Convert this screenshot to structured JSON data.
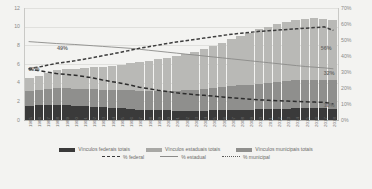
{
  "chart_data": {
    "type": "bar",
    "title": "",
    "subtitle": "",
    "xlabel": "",
    "ylabel": "",
    "y2label": "",
    "grid": true,
    "legend_position": "bottom",
    "categories": [
      "1985",
      "1986",
      "1987",
      "1988",
      "1989",
      "1990",
      "1991",
      "1992",
      "1993",
      "1994",
      "1995",
      "1996",
      "1997",
      "1998",
      "1999",
      "2000",
      "2001",
      "2002",
      "2003",
      "2004",
      "2005",
      "2006",
      "2007",
      "2008",
      "2009",
      "2010",
      "2011",
      "2012",
      "2013",
      "2014",
      "2015",
      "2016",
      "2017",
      "2018"
    ],
    "ylim": [
      0,
      12
    ],
    "yticks": [
      "0",
      "2",
      "4",
      "6",
      "8",
      "10",
      "12"
    ],
    "y2lim": [
      0,
      70
    ],
    "y2ticks": [
      "0%",
      "10%",
      "20%",
      "30%",
      "40%",
      "50%",
      "60%",
      "70%"
    ],
    "series": [
      {
        "name": "Vínculos federais totais",
        "type": "bar-stack",
        "color": "#3a3a3a",
        "values": [
          1.55,
          1.58,
          1.6,
          1.62,
          1.58,
          1.55,
          1.5,
          1.42,
          1.35,
          1.3,
          1.25,
          1.2,
          1.12,
          1.08,
          1.05,
          1.02,
          1.0,
          0.98,
          0.98,
          1.0,
          1.02,
          1.05,
          1.08,
          1.1,
          1.12,
          1.15,
          1.18,
          1.2,
          1.22,
          1.24,
          1.25,
          1.25,
          1.24,
          1.22
        ]
      },
      {
        "name": "Vínculos estaduais totais",
        "type": "bar-stack",
        "color": "#8f8f8d",
        "values": [
          1.55,
          1.62,
          1.7,
          1.78,
          1.8,
          1.82,
          1.84,
          1.86,
          1.88,
          1.9,
          1.95,
          2.0,
          2.02,
          2.05,
          2.08,
          2.12,
          2.16,
          2.2,
          2.26,
          2.32,
          2.38,
          2.45,
          2.52,
          2.6,
          2.68,
          2.76,
          2.84,
          2.9,
          2.96,
          3.02,
          3.06,
          3.08,
          3.06,
          3.02
        ]
      },
      {
        "name": "Vínculos municipais totais",
        "type": "bar-stack",
        "color": "#b9b9b6",
        "values": [
          1.4,
          1.55,
          1.75,
          1.95,
          2.05,
          2.15,
          2.25,
          2.35,
          2.48,
          2.6,
          2.75,
          2.92,
          3.05,
          3.2,
          3.38,
          3.55,
          3.72,
          3.9,
          4.1,
          4.32,
          4.55,
          4.8,
          5.05,
          5.3,
          5.55,
          5.8,
          6.0,
          6.18,
          6.32,
          6.45,
          6.52,
          6.55,
          6.52,
          6.48
        ]
      },
      {
        "name": "% federal",
        "type": "line",
        "style": "dashed",
        "color": "#2d2d2d",
        "axis": "right",
        "values": [
          32.0,
          31.0,
          30.0,
          29.0,
          28.5,
          28.0,
          27.2,
          26.2,
          25.0,
          24.0,
          23.0,
          21.8,
          20.5,
          19.6,
          18.6,
          17.8,
          17.0,
          16.4,
          15.8,
          15.4,
          14.9,
          14.4,
          13.9,
          13.4,
          13.0,
          12.6,
          12.3,
          12.0,
          11.8,
          11.6,
          11.4,
          11.2,
          11.0,
          10.0
        ]
      },
      {
        "name": "% estadual",
        "type": "line",
        "style": "solid",
        "color": "#8b8b89",
        "axis": "right",
        "values": [
          49.0,
          48.6,
          48.2,
          47.8,
          47.5,
          47.2,
          46.8,
          46.4,
          46.0,
          45.6,
          45.2,
          44.8,
          44.2,
          43.6,
          43.0,
          42.4,
          41.8,
          41.2,
          40.6,
          40.0,
          39.4,
          38.8,
          38.2,
          37.6,
          37.0,
          36.4,
          35.8,
          35.2,
          34.6,
          34.0,
          33.4,
          33.0,
          32.6,
          32.0
        ]
      },
      {
        "name": "% municipal",
        "type": "line",
        "style": "dotted",
        "color": "#3d3d3d",
        "axis": "right",
        "values": [
          32.0,
          33.0,
          34.2,
          35.4,
          36.2,
          37.0,
          38.0,
          39.0,
          40.2,
          41.2,
          42.4,
          43.6,
          44.8,
          45.8,
          46.8,
          47.8,
          48.8,
          49.6,
          50.4,
          51.2,
          52.0,
          52.8,
          53.6,
          54.2,
          54.8,
          55.4,
          55.8,
          56.2,
          56.6,
          57.0,
          57.4,
          57.8,
          58.2,
          56.0
        ]
      }
    ],
    "annotations": [
      {
        "text": "49%",
        "x_pct": 10.5,
        "y_px": 38
      },
      {
        "text": "32%",
        "x_pct": 1.5,
        "y_px": 59
      },
      {
        "text": "56%",
        "x_pct": 94.5,
        "y_px": 38
      },
      {
        "text": "32%",
        "x_pct": 95.5,
        "y_px": 63
      },
      {
        "text": "10%",
        "x_pct": 95.5,
        "y_px": 95
      }
    ]
  },
  "legend": {
    "row1": [
      {
        "label": "Vínculos federais totais",
        "swatch": "sw-fed"
      },
      {
        "label": "Vínculos estaduais totais",
        "swatch": "sw-est"
      },
      {
        "label": "Vínculos municipais totais",
        "swatch": "sw-mun"
      }
    ],
    "row2": [
      {
        "label": "% federal",
        "swatch": "ls-dashed-fed"
      },
      {
        "label": "% estadual",
        "swatch": "ls-solid-est"
      },
      {
        "label": "% municipal",
        "swatch": "ls-dotted-mun"
      }
    ]
  }
}
